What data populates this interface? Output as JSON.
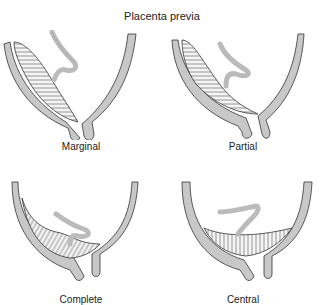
{
  "title": "Placenta previa",
  "panels": [
    {
      "label": "Marginal"
    },
    {
      "label": "Partial"
    },
    {
      "label": "Complete"
    },
    {
      "label": "Central"
    }
  ],
  "colors": {
    "wall": "#c8c8c8",
    "outline": "#333333",
    "placenta_hatch": "#555555",
    "cord": "#d8d8d8",
    "background": "#ffffff"
  }
}
